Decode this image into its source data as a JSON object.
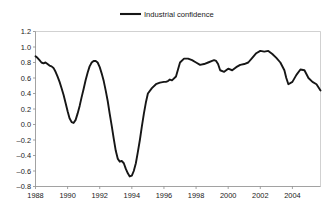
{
  "chart_data": {
    "type": "line",
    "title": "",
    "xlabel": "",
    "ylabel": "",
    "xlim": [
      1988,
      2005.75
    ],
    "ylim": [
      -0.8,
      1.2
    ],
    "ytick_step": 0.2,
    "grid": false,
    "legend_position": "top-center",
    "legend": [
      "Industrial confidence"
    ],
    "yticks": [
      "1.2",
      "1.0",
      "0.8",
      "0.6",
      "0.4",
      "0.2",
      "0.0",
      "-0.2",
      "-0.4",
      "-0.6",
      "-0.8"
    ],
    "ytick_values": [
      1.2,
      1.0,
      0.8,
      0.6,
      0.4,
      0.2,
      0.0,
      -0.2,
      -0.4,
      -0.6,
      -0.8
    ],
    "xticks": [
      "1988",
      "1990",
      "1992",
      "1994",
      "1996",
      "1998",
      "2000",
      "2002",
      "2004"
    ],
    "xtick_values": [
      1988,
      1990,
      1992,
      1994,
      1996,
      1998,
      2000,
      2002,
      2004
    ],
    "series": [
      {
        "name": "Industrial confidence",
        "color": "#161616",
        "x": [
          1988.0,
          1988.12,
          1988.25,
          1988.37,
          1988.5,
          1988.62,
          1988.75,
          1988.87,
          1989.0,
          1989.12,
          1989.25,
          1989.37,
          1989.5,
          1989.62,
          1989.75,
          1989.87,
          1990.0,
          1990.12,
          1990.25,
          1990.37,
          1990.5,
          1990.62,
          1990.75,
          1990.87,
          1991.0,
          1991.12,
          1991.25,
          1991.37,
          1991.5,
          1991.62,
          1991.75,
          1991.87,
          1992.0,
          1992.12,
          1992.25,
          1992.37,
          1992.5,
          1992.62,
          1992.75,
          1992.87,
          1993.0,
          1993.12,
          1993.25,
          1993.37,
          1993.5,
          1993.62,
          1993.75,
          1993.87,
          1994.0,
          1994.12,
          1994.25,
          1994.37,
          1994.5,
          1994.62,
          1994.75,
          1994.87,
          1995.0,
          1995.25,
          1995.5,
          1995.75,
          1996.0,
          1996.12,
          1996.25,
          1996.37,
          1996.5,
          1996.75,
          1997.0,
          1997.25,
          1997.5,
          1997.75,
          1998.0,
          1998.25,
          1998.5,
          1998.75,
          1999.0,
          1999.12,
          1999.25,
          1999.37,
          1999.5,
          1999.75,
          2000.0,
          2000.25,
          2000.5,
          2000.75,
          2001.0,
          2001.25,
          2001.5,
          2001.75,
          2002.0,
          2002.25,
          2002.5,
          2002.75,
          2003.0,
          2003.25,
          2003.5,
          2003.62,
          2003.75,
          2004.0,
          2004.25,
          2004.5,
          2004.75,
          2005.0,
          2005.25,
          2005.5,
          2005.75
        ],
        "y": [
          0.88,
          0.86,
          0.83,
          0.8,
          0.79,
          0.8,
          0.78,
          0.76,
          0.75,
          0.73,
          0.68,
          0.62,
          0.55,
          0.47,
          0.38,
          0.28,
          0.17,
          0.08,
          0.03,
          0.02,
          0.06,
          0.14,
          0.24,
          0.35,
          0.46,
          0.57,
          0.67,
          0.75,
          0.8,
          0.82,
          0.82,
          0.8,
          0.74,
          0.66,
          0.56,
          0.44,
          0.3,
          0.14,
          -0.02,
          -0.18,
          -0.34,
          -0.44,
          -0.48,
          -0.47,
          -0.5,
          -0.57,
          -0.63,
          -0.67,
          -0.66,
          -0.6,
          -0.5,
          -0.36,
          -0.2,
          -0.03,
          0.14,
          0.28,
          0.4,
          0.47,
          0.52,
          0.54,
          0.55,
          0.55,
          0.56,
          0.58,
          0.57,
          0.62,
          0.8,
          0.85,
          0.85,
          0.83,
          0.8,
          0.77,
          0.78,
          0.8,
          0.82,
          0.83,
          0.82,
          0.78,
          0.7,
          0.68,
          0.72,
          0.7,
          0.74,
          0.77,
          0.78,
          0.8,
          0.86,
          0.92,
          0.95,
          0.94,
          0.95,
          0.91,
          0.86,
          0.8,
          0.7,
          0.6,
          0.52,
          0.55,
          0.64,
          0.71,
          0.7,
          0.6,
          0.55,
          0.52,
          0.44
        ]
      }
    ]
  },
  "legend": {
    "label": "Industrial confidence"
  }
}
